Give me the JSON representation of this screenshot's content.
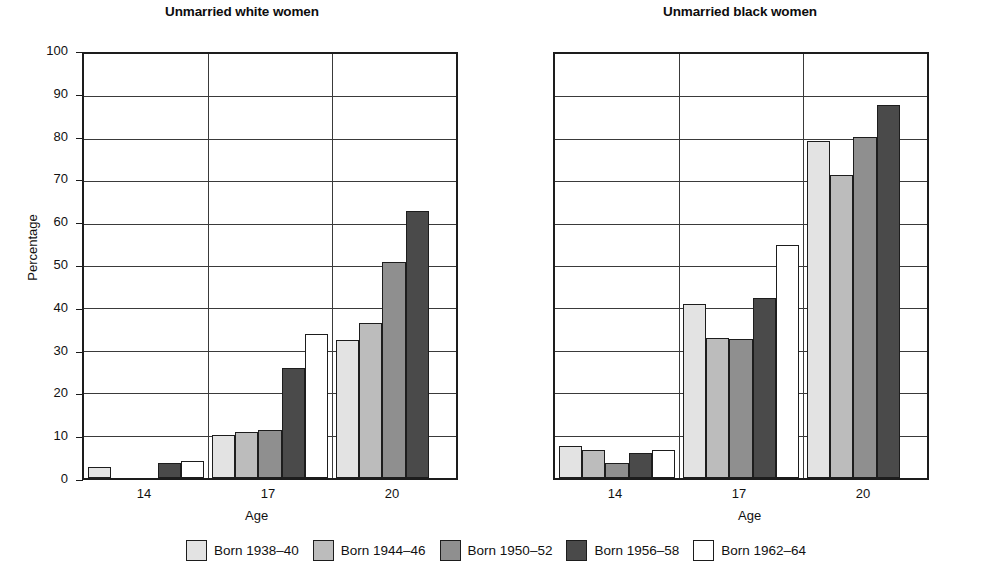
{
  "chart_data": {
    "type": "bar",
    "title": "",
    "panels": [
      {
        "title": "Unmarried white women",
        "xlabel": "Age",
        "ylabel": "Percentage",
        "categories": [
          "14",
          "17",
          "20"
        ],
        "series": [
          {
            "name": "Born 1938–40",
            "color": "#e3e3e3",
            "values": [
              2.5,
              10.2,
              32.5
            ]
          },
          {
            "name": "Born 1944–46",
            "color": "#bcbcbc",
            "values": [
              0,
              10.8,
              36.5
            ]
          },
          {
            "name": "Born 1950–52",
            "color": "#8f8f8f",
            "values": [
              0,
              11.4,
              51.0
            ]
          },
          {
            "name": "Born 1956–58",
            "color": "#4a4a4a",
            "values": [
              3.5,
              26.0,
              63.0
            ]
          },
          {
            "name": "Born 1962–64",
            "color": "#ffffff",
            "values": [
              4.0,
              34.0,
              0
            ]
          }
        ]
      },
      {
        "title": "Unmarried black women",
        "xlabel": "Age",
        "ylabel": "Percentage",
        "categories": [
          "14",
          "17",
          "20"
        ],
        "series": [
          {
            "name": "Born 1938–40",
            "color": "#e3e3e3",
            "values": [
              7.5,
              41.0,
              79.5
            ]
          },
          {
            "name": "Born 1944–46",
            "color": "#bcbcbc",
            "values": [
              6.5,
              33.0,
              71.5
            ]
          },
          {
            "name": "Born 1950–52",
            "color": "#8f8f8f",
            "values": [
              3.5,
              32.8,
              80.5
            ]
          },
          {
            "name": "Born 1956–58",
            "color": "#4a4a4a",
            "values": [
              6.0,
              42.5,
              88.0
            ]
          },
          {
            "name": "Born 1962–64",
            "color": "#ffffff",
            "values": [
              6.5,
              55.0,
              0
            ]
          }
        ]
      }
    ],
    "ylim": [
      0,
      100
    ],
    "yticks": [
      0,
      10,
      20,
      30,
      40,
      50,
      60,
      70,
      80,
      90,
      100
    ],
    "ytick_labels": [
      "0",
      "10",
      "20",
      "30",
      "40",
      "50",
      "60",
      "70",
      "80",
      "90",
      "100"
    ],
    "grid": "horizontal-and-vertical-group-separators",
    "legend_position": "bottom-center",
    "legend": [
      "Born 1938–40",
      "Born 1944–46",
      "Born 1950–52",
      "Born 1956–58",
      "Born 1962–64"
    ]
  },
  "figure": {
    "ylabel": "Percentage",
    "panel_white_title": "Unmarried white women",
    "panel_black_title": "Unmarried black women",
    "xlabel": "Age"
  }
}
